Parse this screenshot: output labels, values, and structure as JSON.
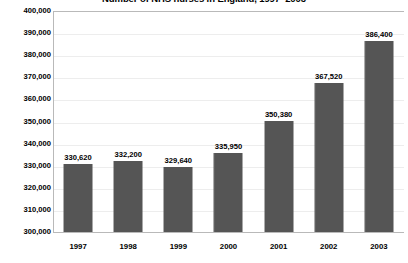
{
  "chart_data": {
    "type": "bar",
    "title": "Number of NHS nurses in England, 1997–2003",
    "xlabel": "",
    "ylabel": "",
    "categories": [
      "1997",
      "1998",
      "1999",
      "2000",
      "2001",
      "2002",
      "2003"
    ],
    "values": [
      330620,
      332200,
      329640,
      335950,
      350380,
      367520,
      386400
    ],
    "value_labels": [
      "330,620",
      "332,200",
      "329,640",
      "335,950",
      "350,380",
      "367,520",
      "386,400"
    ],
    "ylim": [
      300000,
      400000
    ],
    "ytick_step": 10000,
    "ytick_labels": [
      "400,000",
      "390,000",
      "380,000",
      "370,000",
      "360,000",
      "350,000",
      "340,000",
      "330,000",
      "320,000",
      "310,000",
      "300,000"
    ],
    "grid": true,
    "legend": false,
    "bar_color": "#585858",
    "grid_color": "#ededed",
    "axis_color": "#b9b9b9",
    "background": "#ffffff"
  }
}
